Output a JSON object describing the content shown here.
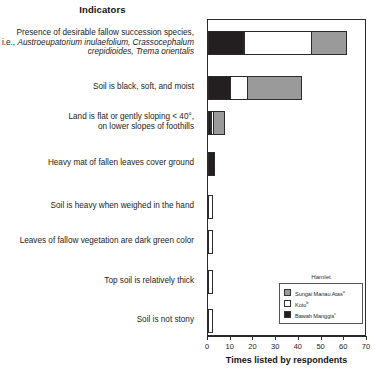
{
  "chart_data": {
    "type": "bar",
    "orientation": "horizontal",
    "stacked": true,
    "title": "Indicators",
    "xlabel": "Times listed by respondents",
    "ylabel": "",
    "xlim": [
      0,
      70
    ],
    "xticks": [
      0,
      10,
      20,
      30,
      40,
      50,
      60,
      70
    ],
    "grid": false,
    "legend_position": "inside-bottom-right",
    "legend_title": "Hamlet",
    "categories": [
      "Presence of desirable fallow succession species, i.e., Austroeupatorium inulaefolium, Crassocephalum crepidioides, Trema orientalis",
      "Soil is black, soft, and moist",
      "Land is flat or gently sloping < 40°, on lower slopes of foothills",
      "Heavy mat of fallen leaves cover ground",
      "Soil is heavy when weighed in the hand",
      "Leaves of fallow vegetation are dark green color",
      "Top soil is relatively thick",
      "Soil is not stony"
    ],
    "series": [
      {
        "name": "Bawah Manggis",
        "color": "#231f20",
        "values": [
          16,
          10,
          1.5,
          3,
          0,
          0,
          0,
          0
        ]
      },
      {
        "name": "Koto",
        "color": "#ffffff",
        "values": [
          30,
          8,
          1.5,
          0,
          2,
          2,
          2,
          2
        ]
      },
      {
        "name": "Sungai Manau Atas",
        "color": "#9a9a9a",
        "values": [
          16,
          24,
          5,
          0,
          0,
          0,
          0,
          0
        ]
      }
    ],
    "totals": [
      62,
      42,
      8,
      3,
      2,
      2,
      2,
      2
    ]
  },
  "labels": {
    "rows": [
      {
        "line1": "Presence of desirable fallow succession species,",
        "line2_plain": "i.e., ",
        "line2_italic": "Austroeupatorium inulaefolium, Crassocephalum",
        "line3_italic": "crepidioides, Trema orientalis"
      },
      {
        "line1": "Soil is black, soft, and moist"
      },
      {
        "line1": "Land is flat or gently sloping < 40°,",
        "line2_plain": "on lower slopes of foothills"
      },
      {
        "line1": "Heavy mat of fallen leaves cover ground"
      },
      {
        "line1": "Soil is heavy when weighed in the hand"
      },
      {
        "line1": "Leaves of fallow vegetation are dark green color"
      },
      {
        "line1": "Top soil is relatively thick"
      },
      {
        "line1": "Soil is not stony"
      }
    ]
  },
  "legend": {
    "title": "Hamlet",
    "items": [
      {
        "label": "Sungai Manau Atas",
        "marker": "a",
        "color": "#9a9a9a"
      },
      {
        "label": "Koto",
        "marker": "b",
        "color": "#ffffff"
      },
      {
        "label": "Bawah Manggis",
        "marker": "c",
        "color": "#231f20"
      }
    ]
  },
  "axis": {
    "xtick_labels": [
      "0",
      "10",
      "20",
      "30",
      "40",
      "50",
      "60",
      "70"
    ],
    "xlabel": "Times listed by respondents"
  }
}
